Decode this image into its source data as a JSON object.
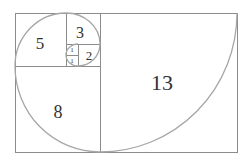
{
  "diagram": {
    "title": "",
    "colors": {
      "lines": "#8c8c8c",
      "spiral": "#a6a6a6",
      "text": "#333333",
      "background": "#ffffff"
    },
    "squares": [
      {
        "id": "sq13",
        "label": "13",
        "x": 100,
        "y": 13,
        "w": 137,
        "h": 139,
        "font": 22,
        "lx": 162,
        "ly": 82
      },
      {
        "id": "sq8",
        "label": "8",
        "x": 15,
        "y": 66,
        "w": 85,
        "h": 86,
        "font": 18,
        "lx": 58,
        "ly": 112
      },
      {
        "id": "sq5",
        "label": "5",
        "x": 15,
        "y": 13,
        "w": 51,
        "h": 53,
        "font": 17,
        "lx": 40,
        "ly": 43
      },
      {
        "id": "sq3",
        "label": "3",
        "x": 66,
        "y": 13,
        "w": 34,
        "h": 31,
        "font": 16,
        "lx": 80,
        "ly": 32
      },
      {
        "id": "sq2",
        "label": "2",
        "x": 78,
        "y": 44,
        "w": 22,
        "h": 22,
        "font": 13,
        "lx": 88,
        "ly": 55
      },
      {
        "id": "sq1a",
        "label": "1",
        "x": 66,
        "y": 44,
        "w": 12,
        "h": 11,
        "font": 7,
        "lx": 72,
        "ly": 50
      },
      {
        "id": "sq1b",
        "label": "1",
        "x": 66,
        "y": 55,
        "w": 12,
        "h": 11,
        "font": 7,
        "lx": 72,
        "ly": 61
      }
    ]
  }
}
